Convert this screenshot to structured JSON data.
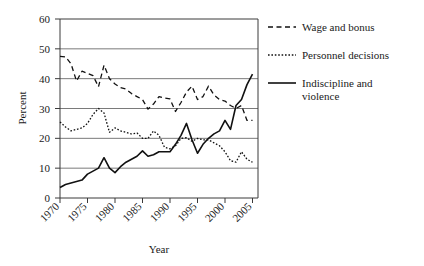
{
  "chart_data": {
    "type": "line",
    "title": "",
    "xlabel": "Year",
    "ylabel": "Percent",
    "xlim": [
      1970,
      2006
    ],
    "ylim": [
      0,
      60
    ],
    "xticks": [
      "1970",
      "1975",
      "1980",
      "1985",
      "1990",
      "1995",
      "2000",
      "2005"
    ],
    "xtick_values": [
      1970,
      1975,
      1980,
      1985,
      1990,
      1995,
      2000,
      2005
    ],
    "yticks": [
      "0",
      "10",
      "20",
      "30",
      "40",
      "50",
      "60"
    ],
    "ytick_values": [
      0,
      10,
      20,
      30,
      40,
      50,
      60
    ],
    "grid": "horizontal",
    "legend_position": "right",
    "x": [
      1970,
      1971,
      1972,
      1973,
      1974,
      1975,
      1976,
      1977,
      1978,
      1979,
      1980,
      1981,
      1982,
      1983,
      1984,
      1985,
      1986,
      1987,
      1988,
      1989,
      1990,
      1991,
      1992,
      1993,
      1994,
      1995,
      1996,
      1997,
      1998,
      1999,
      2000,
      2001,
      2002,
      2003,
      2004,
      2005
    ],
    "series": [
      {
        "name": "Wage and bonus",
        "style": "dashed",
        "color": "#111111",
        "values": [
          47.5,
          47.3,
          45.0,
          39.2,
          42.5,
          41.8,
          41.0,
          37.3,
          44.5,
          40.0,
          38.2,
          37.0,
          36.5,
          35.0,
          34.0,
          33.0,
          29.8,
          31.5,
          34.0,
          33.5,
          33.2,
          29.0,
          32.0,
          35.5,
          37.5,
          33.0,
          34.0,
          37.5,
          34.5,
          33.0,
          32.5,
          31.0,
          30.0,
          31.0,
          26.0,
          26.0
        ]
      },
      {
        "name": "Personnel decisions",
        "style": "dotted",
        "color": "#111111",
        "values": [
          25.5,
          23.8,
          22.5,
          23.0,
          23.5,
          25.0,
          28.0,
          30.0,
          28.5,
          22.0,
          23.5,
          22.5,
          22.0,
          21.5,
          21.8,
          20.0,
          20.0,
          22.5,
          21.0,
          17.0,
          16.5,
          17.5,
          20.0,
          20.2,
          19.0,
          20.0,
          19.5,
          19.5,
          18.5,
          17.5,
          15.5,
          12.5,
          12.0,
          15.5,
          13.0,
          12.0
        ]
      },
      {
        "name": "Indiscipline and violence",
        "style": "solid",
        "color": "#111111",
        "values": [
          3.5,
          4.5,
          5.0,
          5.5,
          6.0,
          8.0,
          9.0,
          10.0,
          13.5,
          10.0,
          8.5,
          10.5,
          12.0,
          13.0,
          14.0,
          15.8,
          14.0,
          14.5,
          15.5,
          15.5,
          15.5,
          18.0,
          21.0,
          25.0,
          19.5,
          15.0,
          18.0,
          20.0,
          21.5,
          22.5,
          26.0,
          23.0,
          31.0,
          33.0,
          38.0,
          41.5
        ]
      }
    ]
  },
  "legend": {
    "items": [
      {
        "label": "Wage and bonus",
        "style": "dashed"
      },
      {
        "label": "Personnel decisions",
        "style": "dotted"
      },
      {
        "label": "Indiscipline and",
        "label2": "violence",
        "style": "solid"
      }
    ]
  }
}
